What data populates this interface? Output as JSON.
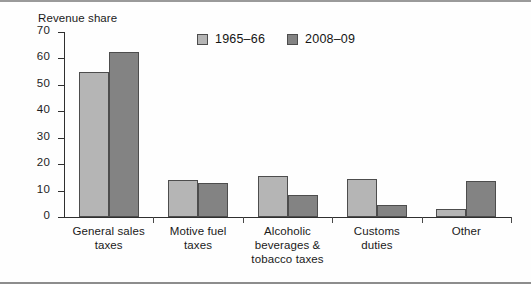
{
  "chart_data": {
    "type": "bar",
    "title": "",
    "ylabel": "Revenue share",
    "xlabel": "",
    "ylim": [
      0,
      70
    ],
    "yticks": [
      0,
      10,
      20,
      30,
      40,
      50,
      60,
      70
    ],
    "grid": false,
    "legend_position": "top-center",
    "categories": [
      "General sales taxes",
      "Motive fuel taxes",
      "Alcoholic beverages & tobacco taxes",
      "Customs duties",
      "Other"
    ],
    "category_lines": [
      [
        "General sales",
        "taxes"
      ],
      [
        "Motive fuel",
        "taxes"
      ],
      [
        "Alcoholic",
        "beverages &",
        "tobacco taxes"
      ],
      [
        "Customs",
        "duties"
      ],
      [
        "Other"
      ]
    ],
    "series": [
      {
        "name": "1965–66",
        "color": "#b5b5b5",
        "values": [
          55,
          14,
          15.5,
          14.5,
          3
        ]
      },
      {
        "name": "2008–09",
        "color": "#838383",
        "values": [
          62.5,
          13,
          8.5,
          4.5,
          13.5
        ]
      }
    ]
  },
  "colors": {
    "series_1965_66": "#b5b5b5",
    "series_2008_09": "#838383",
    "axis": "#2f2f2f",
    "bar_outline": "#4d4d4d",
    "frame": "#9a9a9a",
    "background": "#ffffff"
  }
}
